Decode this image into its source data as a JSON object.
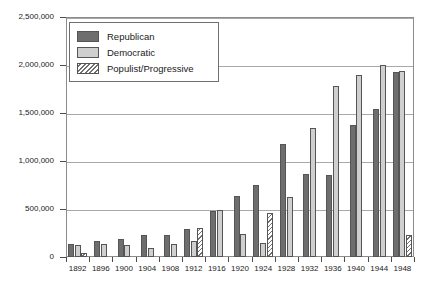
{
  "chart_data": {
    "type": "bar",
    "title": "",
    "subtitle": "",
    "xlabel": "",
    "ylabel": "",
    "grid": true,
    "legend_position": "top-left",
    "ylim": [
      0,
      2500000
    ],
    "ytick_values": [
      0,
      500000,
      1000000,
      1500000,
      2000000,
      2500000
    ],
    "ytick_labels": [
      "0",
      "500,000",
      "1,000,000",
      "1,500,000",
      "2,000,000",
      "2,500,000"
    ],
    "categories": [
      "1892",
      "1896",
      "1900",
      "1904",
      "1908",
      "1912",
      "1916",
      "1920",
      "1924",
      "1928",
      "1932",
      "1936",
      "1940",
      "1944",
      "1948"
    ],
    "series": [
      {
        "name": "Republican",
        "color": "#6e6e6e",
        "values": [
          135000,
          170000,
          185000,
          225000,
          230000,
          290000,
          480000,
          640000,
          745000,
          1175000,
          860000,
          850000,
          1375000,
          1540000,
          1925000
        ]
      },
      {
        "name": "Democratic",
        "color": "#cfcfcf",
        "values": [
          125000,
          135000,
          125000,
          95000,
          135000,
          170000,
          490000,
          235000,
          145000,
          620000,
          1345000,
          1785000,
          1895000,
          2005000,
          1935000
        ]
      },
      {
        "name": "Populist/Progressive",
        "color": "#ffffff",
        "hatch": "diagonal",
        "values": [
          40000,
          null,
          null,
          null,
          null,
          300000,
          null,
          null,
          455000,
          null,
          null,
          null,
          null,
          null,
          230000
        ]
      }
    ]
  },
  "legend": {
    "items": [
      {
        "label": "Republican",
        "swatch": "rep"
      },
      {
        "label": "Democratic",
        "swatch": "dem"
      },
      {
        "label": "Populist/Progressive",
        "swatch": "pop"
      }
    ]
  }
}
